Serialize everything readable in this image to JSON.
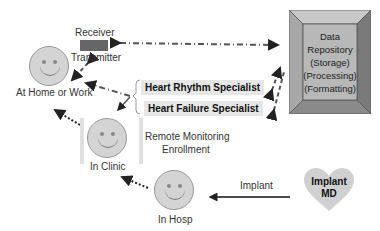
{
  "receiver": {
    "label": "Receiver",
    "transmitter_label": "Transmitter"
  },
  "locations": {
    "home": "At Home or Work",
    "clinic": "In Clinic",
    "hosp": "In Hosp"
  },
  "specialists": [
    "Heart Rhythm Specialist",
    "Heart Failure Specialist"
  ],
  "repository": {
    "lines": [
      "Data",
      "Repository",
      "(Storage)",
      "(Processing)",
      "(Formatting)"
    ]
  },
  "remote_monitoring": {
    "line1": "Remote Monitoring",
    "line2": "Enrollment"
  },
  "implant": {
    "arrow_label": "Implant",
    "md_line1": "Implant",
    "md_line2": "MD"
  },
  "colors": {
    "face": "#d4d4d4",
    "receiver": "#666666",
    "repo_face": "#b8b8b8",
    "spec_bg": "#e6e6e6"
  }
}
